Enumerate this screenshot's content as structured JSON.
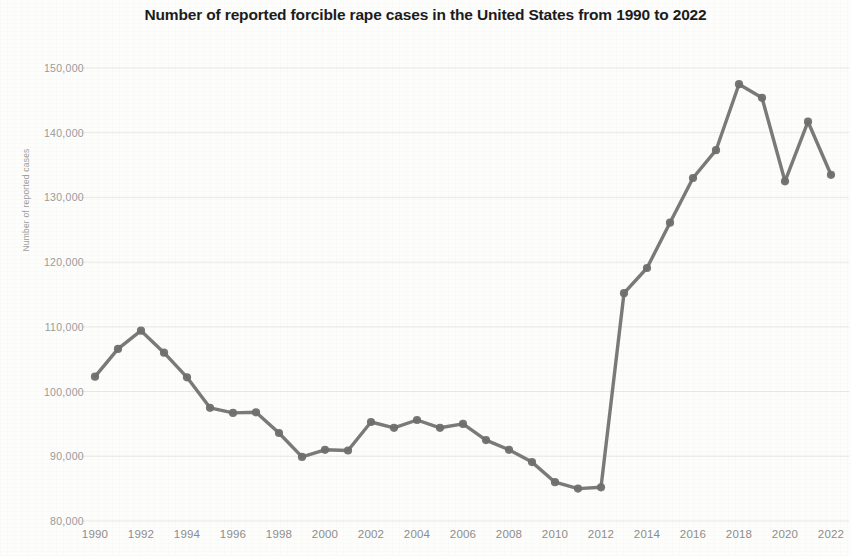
{
  "chart_data": {
    "type": "line",
    "title": "Number of reported forcible rape cases in the United States from 1990 to 2022",
    "xlabel": "",
    "ylabel": "Number of reported cases",
    "grid": true,
    "legend": false,
    "xlim": [
      1990,
      2022
    ],
    "ylim": [
      80000,
      150000
    ],
    "y_ticks": [
      150000,
      140000,
      130000,
      120000,
      110000,
      100000,
      90000,
      80000
    ],
    "y_tick_labels": [
      "150,000",
      "140,000",
      "130,000",
      "120,000",
      "110,000",
      "100,000",
      "90,000",
      "80,000"
    ],
    "x_ticks": [
      1990,
      1992,
      1994,
      1996,
      1998,
      2000,
      2002,
      2004,
      2006,
      2008,
      2010,
      2012,
      2014,
      2016,
      2018,
      2020,
      2022
    ],
    "x_tick_labels": [
      "1990",
      "1992",
      "1994",
      "1996",
      "1998",
      "2000",
      "2002",
      "2004",
      "2006",
      "2008",
      "2010",
      "2012",
      "2014",
      "2016",
      "2018",
      "2020",
      "2022"
    ],
    "x": [
      1990,
      1991,
      1992,
      1993,
      1994,
      1995,
      1996,
      1997,
      1998,
      1999,
      2000,
      2001,
      2002,
      2003,
      2004,
      2005,
      2006,
      2007,
      2008,
      2009,
      2010,
      2011,
      2012,
      2013,
      2014,
      2015,
      2016,
      2017,
      2018,
      2019,
      2020,
      2021,
      2022
    ],
    "values": [
      102300,
      106600,
      109400,
      106000,
      102200,
      97500,
      96700,
      96800,
      93600,
      89900,
      91000,
      90900,
      95300,
      94400,
      95600,
      94400,
      95000,
      92500,
      91000,
      89100,
      86000,
      85000,
      85200,
      115200,
      119100,
      126100,
      133000,
      137300,
      147500,
      145400,
      132500,
      141700,
      133500
    ],
    "series_color": "#6f6f6f",
    "marker": "circle"
  }
}
